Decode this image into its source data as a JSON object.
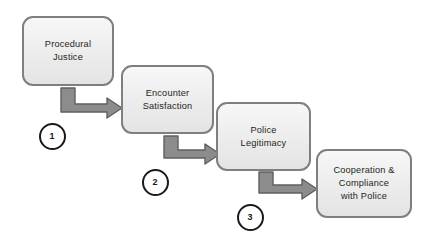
{
  "diagram": {
    "type": "flow-diagram",
    "background_color": "#ffffff",
    "node_fill_color": "#ededed",
    "node_border_color": "#7f7f7f",
    "arrow_fill_color": "#8c8c8c",
    "arrow_border_color": "#5a5a5a",
    "marker_border_color": "#1a1a1a",
    "marker_fill_color": "#ffffff",
    "text_color": "#231f20",
    "nodes": [
      {
        "id": "procedural-justice",
        "label": "Procedural\nJustice",
        "x": 22,
        "y": 16,
        "width": 92,
        "height": 70
      },
      {
        "id": "encounter-satisfaction",
        "label": "Encounter\nSatisfaction",
        "x": 121,
        "y": 65,
        "width": 93,
        "height": 69
      },
      {
        "id": "police-legitimacy",
        "label": "Police\nLegitimacy",
        "x": 216,
        "y": 102,
        "width": 95,
        "height": 69
      },
      {
        "id": "cooperation-compliance",
        "label": "Cooperation &\nCompliance\nwith Police",
        "x": 316,
        "y": 149,
        "width": 96,
        "height": 69
      }
    ],
    "connectors": [
      {
        "id": "connector-1",
        "from": "procedural-justice",
        "to": "encounter-satisfaction",
        "shape": "elbow-down-right"
      },
      {
        "id": "connector-2",
        "from": "encounter-satisfaction",
        "to": "police-legitimacy",
        "shape": "elbow-down-right"
      },
      {
        "id": "connector-3",
        "from": "police-legitimacy",
        "to": "cooperation-compliance",
        "shape": "elbow-down-right"
      }
    ],
    "markers": [
      {
        "id": "step-marker-1",
        "label": "1",
        "cx": 52,
        "cy": 136,
        "r": 13.5
      },
      {
        "id": "step-marker-2",
        "label": "2",
        "cx": 155,
        "cy": 182,
        "r": 13.5
      },
      {
        "id": "step-marker-3",
        "label": "3",
        "cx": 250,
        "cy": 217,
        "r": 13.5
      }
    ]
  }
}
